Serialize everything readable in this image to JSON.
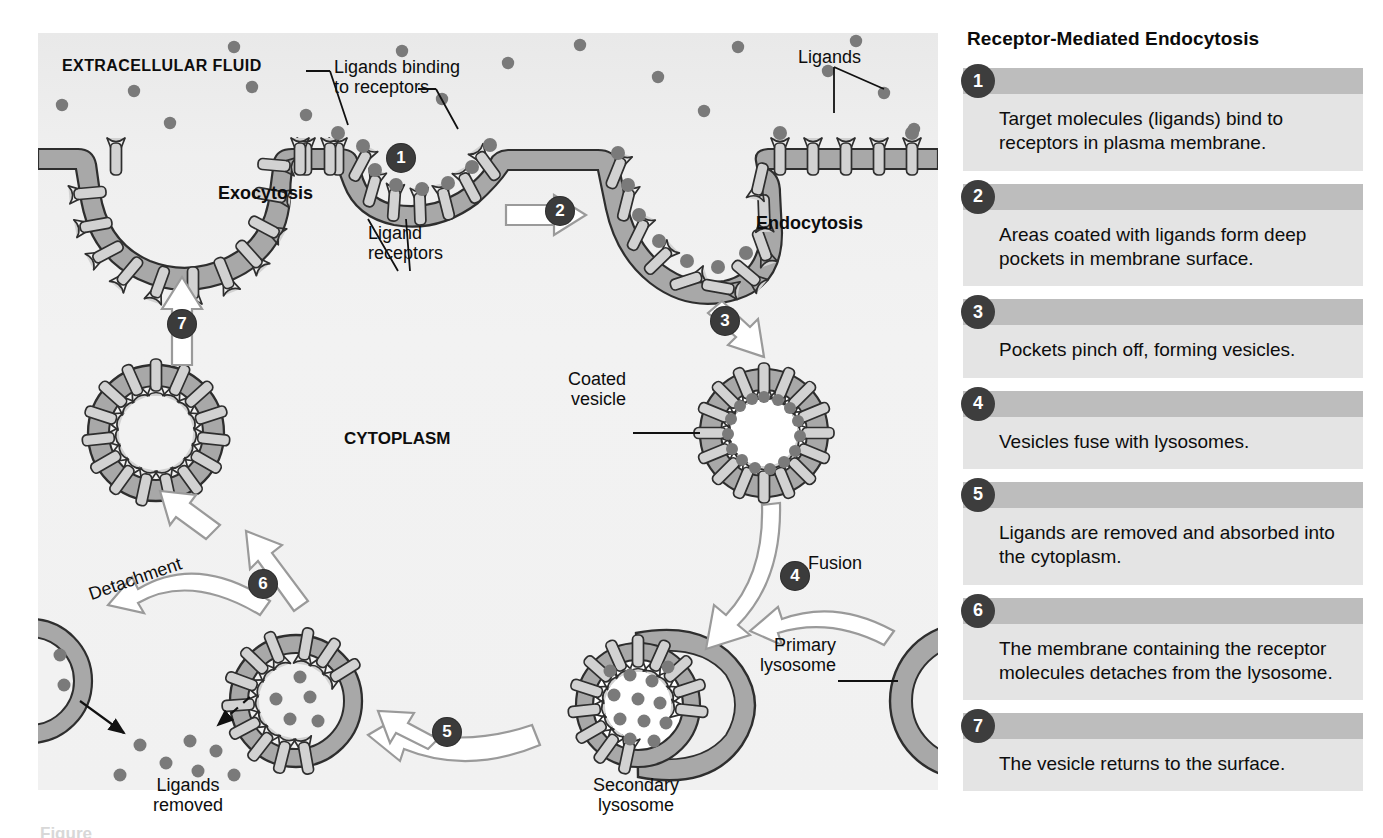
{
  "figure": {
    "diagram_labels": {
      "extracellular_fluid": "EXTRACELLULAR FLUID",
      "cytoplasm": "CYTOPLASM",
      "exocytosis": "Exocytosis",
      "endocytosis": "Endocytosis",
      "ligands": "Ligands",
      "ligands_binding": "Ligands binding\nto receptors",
      "ligand_receptors": "Ligand\nreceptors",
      "coated_vesicle": "Coated\nvesicle",
      "primary_lysosome": "Primary\nlysosome",
      "secondary_lysosome": "Secondary\nlysosome",
      "ligands_removed": "Ligands\nremoved",
      "fusion": "Fusion",
      "detachment": "Detachment"
    },
    "diagram_badges": [
      "1",
      "2",
      "3",
      "4",
      "5",
      "6",
      "7"
    ],
    "bottom_caption": "Figure"
  },
  "list": {
    "title": "Receptor-Mediated Endocytosis",
    "steps": [
      {
        "number": "1",
        "text": "Target molecules (ligands) bind to receptors in plasma membrane."
      },
      {
        "number": "2",
        "text": "Areas coated with ligands form deep pockets in membrane surface."
      },
      {
        "number": "3",
        "text": "Pockets pinch off, forming vesicles."
      },
      {
        "number": "4",
        "text": "Vesicles fuse with lysosomes."
      },
      {
        "number": "5",
        "text": "Ligands are removed and absorbed into the cytoplasm."
      },
      {
        "number": "6",
        "text": "The membrane containing the receptor molecules detaches from the lysosome."
      },
      {
        "number": "7",
        "text": "The vesicle returns to the surface."
      }
    ]
  },
  "colors": {
    "membrane_fill": "#a8a8a8",
    "membrane_stroke": "#2e2e2e",
    "receptor_fill": "#d2d2d2",
    "ligand_fill": "#7a7a7a",
    "badge_bg": "#3b3b3b",
    "panel_bg": "#f1f1f1",
    "step_head": "#bdbdbd",
    "step_body": "#e4e4e4",
    "arrow_fill": "#ffffff",
    "arrow_stroke": "#9a9a9a"
  }
}
